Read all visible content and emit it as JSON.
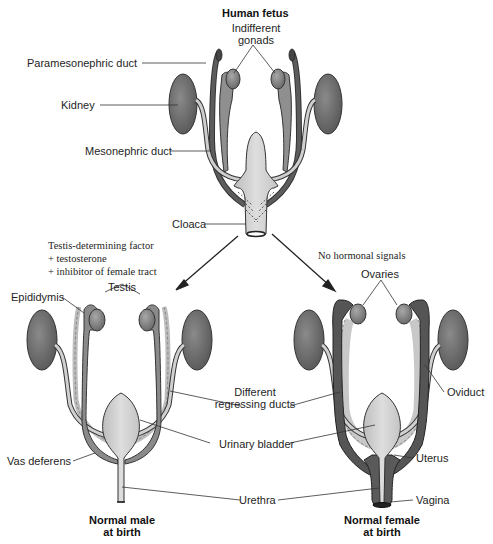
{
  "titles": {
    "fetus": "Human fetus",
    "male_line1": "Normal male",
    "male_line2": "at birth",
    "female_line1": "Normal female",
    "female_line2": "at birth"
  },
  "fetus_labels": {
    "indifferent_gonads_line1": "Indifferent",
    "indifferent_gonads_line2": "gonads",
    "paramesonephric_duct": "Paramesonephric duct",
    "kidney": "Kidney",
    "mesonephric_duct": "Mesonephric duct",
    "cloaca": "Cloaca"
  },
  "signals": {
    "male": [
      "Testis-determining factor",
      "+ testosterone",
      "+ inhibitor of female tract"
    ],
    "female": "No hormonal signals"
  },
  "male_labels": {
    "testis": "Testis",
    "epididymis": "Epididymis",
    "vas_deferens": "Vas deferens"
  },
  "shared_labels": {
    "regressing_ducts_line1": "Different",
    "regressing_ducts_line2": "regressing ducts",
    "urinary_bladder": "Urinary bladder",
    "urethra": "Urethra"
  },
  "female_labels": {
    "ovaries": "Ovaries",
    "oviduct": "Oviduct",
    "uterus": "Uterus",
    "vagina": "Vagina"
  },
  "colors": {
    "kidney": "#6e6e6e",
    "dark_duct": "#5e5e5e",
    "mid_duct": "#8c8c8c",
    "light_duct": "#c9c9c9",
    "bladder": "#d4d4d4",
    "outline": "#2a2a2a"
  }
}
